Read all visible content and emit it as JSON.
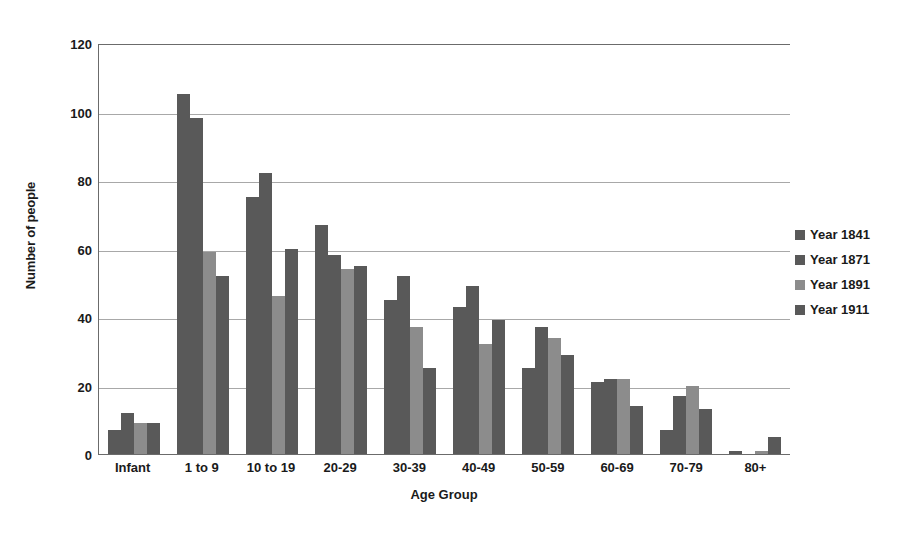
{
  "chart_data": {
    "type": "bar",
    "title": "",
    "xlabel": "Age Group",
    "ylabel": "Number of people",
    "ylim": [
      0,
      120
    ],
    "ytick_step": 20,
    "yticks": [
      0,
      20,
      40,
      60,
      80,
      100,
      120
    ],
    "grid": "horizontal",
    "legend_position": "right",
    "categories": [
      "Infant",
      "1 to 9",
      "10 to 19",
      "20-29",
      "30-39",
      "40-49",
      "50-59",
      "60-69",
      "70-79",
      "80+"
    ],
    "series": [
      {
        "name": "Year 1841",
        "color": "#595959",
        "values": [
          7,
          105,
          75,
          67,
          45,
          43,
          25,
          21,
          7,
          1
        ]
      },
      {
        "name": "Year 1871",
        "color": "#595959",
        "values": [
          12,
          98,
          82,
          58,
          52,
          49,
          37,
          22,
          17,
          0
        ]
      },
      {
        "name": "Year 1891",
        "color": "#8c8c8c",
        "values": [
          9,
          59,
          46,
          54,
          37,
          32,
          34,
          22,
          20,
          1
        ]
      },
      {
        "name": "Year 1911",
        "color": "#595959",
        "values": [
          9,
          52,
          60,
          55,
          25,
          39,
          29,
          14,
          13,
          5
        ]
      }
    ]
  },
  "colors": {
    "axis_line": "#6b6b6b",
    "gridline": "#a8a8a8",
    "text": "#1a1a1a",
    "background": "#ffffff"
  }
}
